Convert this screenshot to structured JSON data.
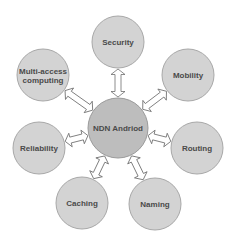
{
  "diagram": {
    "center": {
      "label": "NDN Andriod",
      "cx": 118,
      "cy": 128,
      "r": 30
    },
    "nodes": [
      {
        "id": "security",
        "label": "Security",
        "lines": [
          "Security"
        ],
        "cx": 118,
        "cy": 42,
        "r": 26
      },
      {
        "id": "mobility",
        "label": "Mobility",
        "lines": [
          "Mobility"
        ],
        "cx": 188,
        "cy": 75,
        "r": 26
      },
      {
        "id": "routing",
        "label": "Routing",
        "lines": [
          "Routing"
        ],
        "cx": 197,
        "cy": 148,
        "r": 26
      },
      {
        "id": "naming",
        "label": "Naming",
        "lines": [
          "Naming"
        ],
        "cx": 155,
        "cy": 204,
        "r": 26
      },
      {
        "id": "caching",
        "label": "Caching",
        "lines": [
          "Caching"
        ],
        "cx": 82,
        "cy": 203,
        "r": 26
      },
      {
        "id": "reliability",
        "label": "Reliability",
        "lines": [
          "Reliability"
        ],
        "cx": 39,
        "cy": 148,
        "r": 26
      },
      {
        "id": "multi-access-computing",
        "label": "Multi-access computing",
        "lines": [
          "Multi-access",
          "computing"
        ],
        "cx": 43,
        "cy": 75,
        "r": 26
      }
    ],
    "connector": "double-headed-arrow",
    "colors": {
      "node_fill": "#d3d3d3",
      "center_fill": "#bdbdbd",
      "text": "#4a4a4a",
      "arrow_stroke": "#6e6e6e"
    }
  }
}
